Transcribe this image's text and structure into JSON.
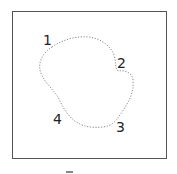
{
  "diagram": {
    "type": "closed-curve-with-numbered-points",
    "points": [
      {
        "label": "1",
        "x": 50,
        "y": 43
      },
      {
        "label": "2",
        "x": 122,
        "y": 63
      },
      {
        "label": "3",
        "x": 122,
        "y": 127
      },
      {
        "label": "4",
        "x": 60,
        "y": 120
      }
    ],
    "curve_style": "dotted",
    "curve_color": "#888888",
    "frame_color": "#555555"
  }
}
